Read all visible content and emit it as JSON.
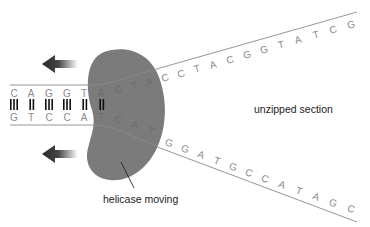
{
  "diagram": {
    "labels": {
      "unzipped": "unzipped section",
      "helicase": "helicase moving"
    },
    "top_strand": {
      "paired": [
        "C",
        "A",
        "G",
        "G",
        "T",
        "A"
      ],
      "inside_helicase": [
        "G",
        "T",
        "A"
      ],
      "unzipped": [
        "C",
        "C",
        "T",
        "A",
        "C",
        "G",
        "G",
        "T",
        "A",
        "T",
        "C",
        "G"
      ]
    },
    "bottom_strand": {
      "paired": [
        "G",
        "T",
        "C",
        "C",
        "A"
      ],
      "inside_helicase": [
        "T",
        "C",
        "A",
        "T"
      ],
      "unzipped": [
        "G",
        "G",
        "A",
        "T",
        "G",
        "C",
        "C",
        "A",
        "T",
        "A",
        "G",
        "C"
      ]
    },
    "base_pair_bonds": [
      3,
      2,
      3,
      3,
      2,
      2
    ],
    "colors": {
      "helicase": "#7b7b7b",
      "strand": "#8a8a8a",
      "bond": "#111111",
      "arrow": "#333333"
    },
    "arrows": [
      {
        "name": "top-direction-arrow",
        "direction": "left"
      },
      {
        "name": "bottom-direction-arrow",
        "direction": "left"
      }
    ]
  }
}
